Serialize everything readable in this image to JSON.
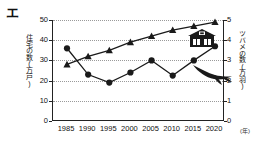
{
  "option_label": "エ",
  "chart_data": {
    "type": "line",
    "title": "",
    "xlabel": "(年)",
    "x": [
      1985,
      1990,
      1995,
      2000,
      2005,
      2010,
      2015,
      2020
    ],
    "categories": [
      "1985",
      "1990",
      "1995",
      "2000",
      "2005",
      "2010",
      "2015",
      "2020"
    ],
    "grid": true,
    "legend_position": "inside-right",
    "axes": {
      "left": {
        "label": "住宅の数(万戸)",
        "ticks": [
          "0",
          "10",
          "20",
          "30",
          "40",
          "50"
        ],
        "tick_values": [
          0,
          10,
          20,
          30,
          40,
          50
        ],
        "ylim": [
          0,
          50
        ]
      },
      "right": {
        "label": "ツバメの数(万羽)",
        "ticks": [
          "0",
          "1",
          "2",
          "3",
          "4",
          "5"
        ],
        "tick_values": [
          0,
          1,
          2,
          3,
          4,
          5
        ],
        "ylim": [
          0,
          5
        ]
      }
    },
    "series": [
      {
        "name": "住宅の数(万戸)",
        "axis": "left",
        "marker": "triangle",
        "icon": "house-icon",
        "color": "#1a1a1a",
        "values": [
          28,
          32,
          35,
          39,
          42,
          45,
          47,
          49
        ]
      },
      {
        "name": "ツバメの数(万羽)",
        "axis": "right",
        "marker": "circle",
        "icon": "swallow-icon",
        "color": "#1a1a1a",
        "values": [
          3.6,
          2.3,
          1.9,
          2.4,
          3.0,
          2.25,
          3.0,
          3.7
        ]
      }
    ]
  },
  "icons": {
    "house": "house-icon",
    "swallow": "swallow-icon"
  },
  "colors": {
    "ink": "#1a1a1a",
    "grid": "#9a9a9a",
    "background": "#ffffff"
  }
}
